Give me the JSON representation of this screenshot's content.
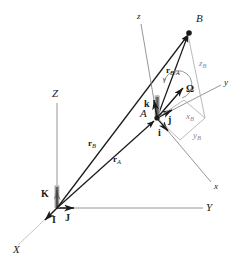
{
  "figure": {
    "type": "vector-kinematics-diagram",
    "colors": {
      "line": "#1a1a1a",
      "construction": "#9a9a9a",
      "background": "#ffffff"
    }
  },
  "fixed_frame": {
    "origin_label": "O",
    "axes": [
      {
        "name": "X-axis-label",
        "label": "X"
      },
      {
        "name": "Y-axis-label",
        "label": "Y"
      },
      {
        "name": "Z-axis-label",
        "label": "Z"
      }
    ],
    "unit_vectors": [
      {
        "name": "I",
        "label": "I"
      },
      {
        "name": "J",
        "label": "J"
      },
      {
        "name": "K",
        "label": "K"
      }
    ]
  },
  "moving_frame": {
    "origin_label": "A",
    "axes": [
      {
        "name": "x-axis-label",
        "label": "x"
      },
      {
        "name": "y-axis-label",
        "label": "y"
      },
      {
        "name": "z-axis-label",
        "label": "z"
      }
    ],
    "unit_vectors": [
      {
        "name": "i",
        "label": "i"
      },
      {
        "name": "j",
        "label": "j"
      },
      {
        "name": "k",
        "label": "k"
      }
    ],
    "angular_velocity": "Ω"
  },
  "points": [
    {
      "name": "point-A",
      "label": "A"
    },
    {
      "name": "point-B",
      "label": "B"
    }
  ],
  "vectors": [
    {
      "name": "r-A",
      "base": "r",
      "sub": "A"
    },
    {
      "name": "r-B",
      "base": "r",
      "sub": "B"
    },
    {
      "name": "r-B-over-A",
      "base": "r",
      "sub": "B/A"
    }
  ],
  "components": [
    {
      "name": "x-component",
      "base": "x",
      "sub": "B"
    },
    {
      "name": "y-component",
      "base": "y",
      "sub": "B"
    },
    {
      "name": "z-component",
      "base": "z",
      "sub": "B"
    }
  ]
}
